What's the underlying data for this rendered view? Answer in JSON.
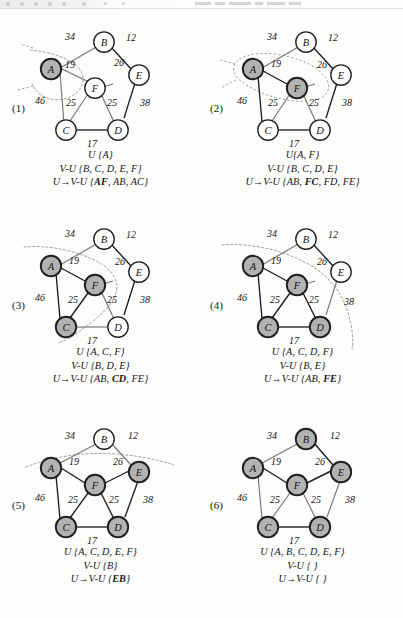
{
  "figure": {
    "kind": "prim-mst-algorithm-steps",
    "graph": {
      "nodes": [
        "A",
        "B",
        "C",
        "D",
        "E",
        "F"
      ],
      "edges": [
        {
          "from": "A",
          "to": "B",
          "weight": "34"
        },
        {
          "from": "B",
          "to": "E",
          "weight": "12"
        },
        {
          "from": "A",
          "to": "F",
          "weight": "19"
        },
        {
          "from": "F",
          "to": "E",
          "weight": "26"
        },
        {
          "from": "A",
          "to": "C",
          "weight": "46"
        },
        {
          "from": "C",
          "to": "F",
          "weight": "25"
        },
        {
          "from": "F",
          "to": "D",
          "weight": "25"
        },
        {
          "from": "D",
          "to": "E",
          "weight": "38"
        },
        {
          "from": "C",
          "to": "D",
          "weight": "17"
        }
      ]
    },
    "panels": [
      {
        "index": "(1)",
        "shaded": [
          "A"
        ],
        "tree_edges": [],
        "caption": {
          "line1": "U {A}",
          "line2": "V-U {B, C, D, E, F}",
          "line3_prefix": "U",
          "line3_arrow": "→",
          "line3_rest": "V-U {",
          "line3_bold": "AF",
          "line3_tail": ", AB, AC}"
        }
      },
      {
        "index": "(2)",
        "shaded": [
          "A",
          "F"
        ],
        "tree_edges": [
          "A-F"
        ],
        "caption": {
          "line1": "U{A, F}",
          "line2": "V-U {B, C, D, E}",
          "line3_prefix": "U",
          "line3_arrow": "→",
          "line3_rest": "V-U {AB, ",
          "line3_bold": "FC",
          "line3_tail": ", FD, FE}"
        }
      },
      {
        "index": "(3)",
        "shaded": [
          "A",
          "C",
          "F"
        ],
        "tree_edges": [
          "A-F",
          "C-F"
        ],
        "caption": {
          "line1": "U {A, C, F}",
          "line2": "V-U {B, D, E}",
          "line3_prefix": "U",
          "line3_arrow": "→",
          "line3_rest": "V-U {AB, ",
          "line3_bold": "CD",
          "line3_tail": ", FE}"
        }
      },
      {
        "index": "(4)",
        "shaded": [
          "A",
          "C",
          "D",
          "F"
        ],
        "tree_edges": [
          "A-F",
          "C-F",
          "F-D",
          "C-D"
        ],
        "caption": {
          "line1": "U {A, C, D, F}",
          "line2": "V-U {B, E}",
          "line3_prefix": "U",
          "line3_arrow": "→",
          "line3_rest": "V-U {AB, ",
          "line3_bold": "FE",
          "line3_tail": "}"
        }
      },
      {
        "index": "(5)",
        "shaded": [
          "A",
          "C",
          "D",
          "E",
          "F"
        ],
        "tree_edges": [
          "A-F",
          "C-F",
          "F-D",
          "C-D",
          "F-E"
        ],
        "caption": {
          "line1": "U {A, C, D, E, F}",
          "line2": "V-U {B}",
          "line3_prefix": "U",
          "line3_arrow": "→",
          "line3_rest": "V-U {",
          "line3_bold": "EB",
          "line3_tail": "}"
        }
      },
      {
        "index": "(6)",
        "shaded": [
          "A",
          "B",
          "C",
          "D",
          "E",
          "F"
        ],
        "tree_edges": [
          "A-F",
          "C-F",
          "F-D",
          "C-D",
          "F-E",
          "B-E"
        ],
        "caption": {
          "line1": "U {A, B, C, D, E, F}",
          "line2": "V-U { }",
          "line3_prefix": "U",
          "line3_arrow": "→",
          "line3_rest": "V-U { }",
          "line3_bold": "",
          "line3_tail": ""
        }
      }
    ]
  },
  "colors": {
    "node_shaded_fill": "#b2b2b2",
    "node_plain_fill": "#ffffff",
    "node_stroke": "#1f1f1f",
    "edge_plain": "#6f6f6f",
    "edge_tree": "#161616",
    "cut_line": "#9a9a9a",
    "page_background": "#fdfdfc"
  }
}
